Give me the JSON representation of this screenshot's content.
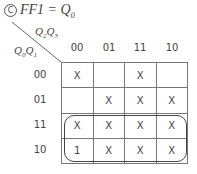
{
  "title": {
    "marker": "C",
    "text": "FF1 = Q0"
  },
  "axes": {
    "col_var": "Q2Q3",
    "row_var": "Q0Q1"
  },
  "columns": [
    "00",
    "01",
    "11",
    "10"
  ],
  "rows": [
    {
      "label": "00",
      "cells": [
        "X",
        "",
        "X",
        ""
      ]
    },
    {
      "label": "01",
      "cells": [
        "",
        "X",
        "X",
        "X"
      ]
    },
    {
      "label": "11",
      "cells": [
        "X",
        "X",
        "X",
        "X"
      ]
    },
    {
      "label": "10",
      "cells": [
        "1",
        "X",
        "X",
        "X"
      ]
    }
  ],
  "grouping": {
    "rows": [
      "11",
      "10"
    ],
    "columns": [
      "00",
      "01",
      "11",
      "10"
    ]
  }
}
